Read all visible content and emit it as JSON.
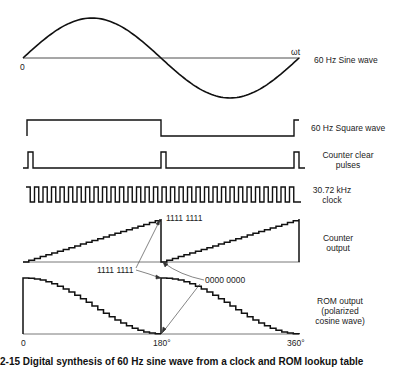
{
  "diagram": {
    "type": "timing-diagram",
    "rows": [
      {
        "id": "sine",
        "label": "60 Hz Sine wave"
      },
      {
        "id": "square",
        "label": "60 Hz Square wave"
      },
      {
        "id": "clear",
        "label_line1": "Counter clear",
        "label_line2": "pulses"
      },
      {
        "id": "clock",
        "label_line1": "30.72 kHz",
        "label_line2": "clock"
      },
      {
        "id": "counter",
        "label_line1": "Counter",
        "label_line2": "output"
      },
      {
        "id": "rom",
        "label_line1": "ROM output",
        "label_line2": "(polarized",
        "label_line3": "cosine wave)"
      }
    ],
    "sine_axis": {
      "origin": "0",
      "x_label": "ωt"
    },
    "annotations": {
      "counter_max_top": "1111  1111",
      "counter_max_mid": "1111  1111",
      "counter_zero": "0000  0000"
    },
    "x_ticks": [
      "0",
      "180°",
      "360°"
    ],
    "caption": "2-15   Digital synthesis of 60 Hz sine wave from a clock and ROM lookup table"
  },
  "colors": {
    "line": "#111111",
    "background": "#ffffff"
  }
}
